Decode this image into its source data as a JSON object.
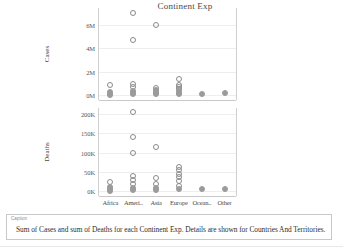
{
  "title": "Continent Exp",
  "caption": {
    "label": "Caption",
    "text": "Sum of Cases and sum of Deaths for each Continent Exp.  Details are shown for Countries And Territories."
  },
  "chart_data": {
    "type": "scatter",
    "title": "Continent Exp",
    "xlabel": "",
    "categories": [
      "Africa",
      "Ameri..",
      "Asia",
      "Europe",
      "Ocean..",
      "Other"
    ],
    "panels": [
      {
        "ylabel": "Cases",
        "yticks": [
          "0M",
          "2M",
          "4M",
          "6M"
        ],
        "ytick_values": [
          0,
          2000000,
          4000000,
          6000000
        ],
        "ylim": [
          -400000,
          7400000
        ],
        "grid": true,
        "series": [
          {
            "name": "Countries And Territories",
            "points": [
              {
                "x": "Africa",
                "y": 900000
              },
              {
                "x": "Africa",
                "y": 260000
              },
              {
                "x": "Africa",
                "y": 120000
              },
              {
                "x": "Africa",
                "y": 60000
              },
              {
                "x": "Ameri..",
                "y": 7000000
              },
              {
                "x": "Ameri..",
                "y": 4700000
              },
              {
                "x": "Ameri..",
                "y": 1000000
              },
              {
                "x": "Ameri..",
                "y": 700000
              },
              {
                "x": "Ameri..",
                "y": 400000
              },
              {
                "x": "Ameri..",
                "y": 200000
              },
              {
                "x": "Ameri..",
                "y": 80000
              },
              {
                "x": "Asia",
                "y": 6000000
              },
              {
                "x": "Asia",
                "y": 600000
              },
              {
                "x": "Asia",
                "y": 420000
              },
              {
                "x": "Asia",
                "y": 300000
              },
              {
                "x": "Asia",
                "y": 180000
              },
              {
                "x": "Asia",
                "y": 90000
              },
              {
                "x": "Europe",
                "y": 1400000
              },
              {
                "x": "Europe",
                "y": 900000
              },
              {
                "x": "Europe",
                "y": 700000
              },
              {
                "x": "Europe",
                "y": 520000
              },
              {
                "x": "Europe",
                "y": 360000
              },
              {
                "x": "Europe",
                "y": 200000
              },
              {
                "x": "Europe",
                "y": 90000
              },
              {
                "x": "Ocean..",
                "y": 120000
              },
              {
                "x": "Other",
                "y": 160000
              }
            ]
          }
        ]
      },
      {
        "ylabel": "Deaths",
        "yticks": [
          "0K",
          "50K",
          "100K",
          "150K",
          "200K"
        ],
        "ytick_values": [
          0,
          50000,
          100000,
          150000,
          200000
        ],
        "ylim": [
          -12000,
          215000
        ],
        "grid": true,
        "series": [
          {
            "name": "Countries And Territories",
            "points": [
              {
                "x": "Africa",
                "y": 24000
              },
              {
                "x": "Africa",
                "y": 12000
              },
              {
                "x": "Africa",
                "y": 6000
              },
              {
                "x": "Africa",
                "y": 2000
              },
              {
                "x": "Ameri..",
                "y": 205000
              },
              {
                "x": "Ameri..",
                "y": 140000
              },
              {
                "x": "Ameri..",
                "y": 100000
              },
              {
                "x": "Ameri..",
                "y": 40000
              },
              {
                "x": "Ameri..",
                "y": 30000
              },
              {
                "x": "Ameri..",
                "y": 18000
              },
              {
                "x": "Ameri..",
                "y": 10000
              },
              {
                "x": "Ameri..",
                "y": 4000
              },
              {
                "x": "Asia",
                "y": 115000
              },
              {
                "x": "Asia",
                "y": 34000
              },
              {
                "x": "Asia",
                "y": 20000
              },
              {
                "x": "Asia",
                "y": 8000
              },
              {
                "x": "Asia",
                "y": 3000
              },
              {
                "x": "Europe",
                "y": 62000
              },
              {
                "x": "Europe",
                "y": 54000
              },
              {
                "x": "Europe",
                "y": 46000
              },
              {
                "x": "Europe",
                "y": 36000
              },
              {
                "x": "Europe",
                "y": 26000
              },
              {
                "x": "Europe",
                "y": 14000
              },
              {
                "x": "Europe",
                "y": 5000
              },
              {
                "x": "Ocean..",
                "y": 6000
              },
              {
                "x": "Other",
                "y": 5000
              }
            ]
          }
        ]
      }
    ]
  }
}
